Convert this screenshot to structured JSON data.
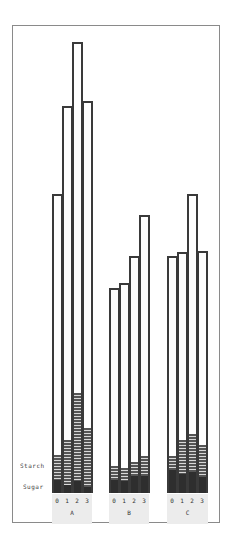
{
  "chart_data": {
    "type": "bar",
    "stacked": true,
    "title": "",
    "xlabel": "",
    "ylabel": "",
    "grid": false,
    "legend_position": "left-inline",
    "groups": [
      "A",
      "B",
      "C"
    ],
    "categories": [
      "0",
      "1",
      "2",
      "3"
    ],
    "series_labels": {
      "starch": "Starch",
      "sugar": "Sugar"
    },
    "units": "relative height (px above baseline)",
    "data": {
      "A": {
        "total": [
          299,
          387,
          451,
          392
        ],
        "starch_top": [
          38,
          53,
          100,
          65
        ],
        "sugar_top": [
          13,
          8,
          12,
          6
        ]
      },
      "B": {
        "total": [
          205,
          210,
          237,
          278
        ],
        "starch_top": [
          27,
          25,
          31,
          37
        ],
        "sugar_top": [
          13,
          12,
          17,
          17
        ]
      },
      "C": {
        "total": [
          237,
          241,
          299,
          242
        ],
        "starch_top": [
          37,
          53,
          59,
          48
        ],
        "sugar_top": [
          23,
          19,
          21,
          16
        ]
      }
    }
  },
  "labels": {
    "starch": "Starch",
    "sugar": "Sugar"
  },
  "groups": [
    {
      "name": "A",
      "ticks": [
        "0",
        "1",
        "2",
        "3"
      ]
    },
    {
      "name": "B",
      "ticks": [
        "0",
        "1",
        "2",
        "3"
      ]
    },
    {
      "name": "C",
      "ticks": [
        "0",
        "1",
        "2",
        "3"
      ]
    }
  ]
}
